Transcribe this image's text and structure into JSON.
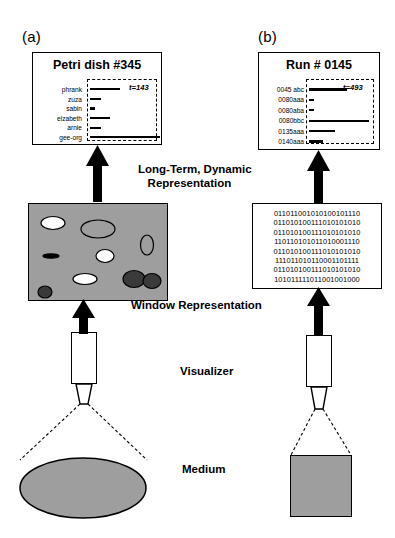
{
  "figure": {
    "panel_a_tag": "(a)",
    "panel_b_tag": "(b)"
  },
  "panel_a": {
    "title": "Petri dish #345",
    "time_label": "t=143",
    "rows": [
      {
        "label": "phrank",
        "bar_width": 30
      },
      {
        "label": "zuza",
        "bar_width": 11
      },
      {
        "label": "sabin",
        "bar_width": 5
      },
      {
        "label": "elzabeth",
        "bar_width": 20
      },
      {
        "label": "arnie",
        "bar_width": 11
      },
      {
        "label": "gee-org",
        "bar_width": 70
      }
    ]
  },
  "panel_b": {
    "title": "Run # 0145",
    "time_label": "t=493",
    "rows": [
      {
        "label": "0045 abc",
        "bar_width": 38
      },
      {
        "label": "0080aaa",
        "bar_width": 5
      },
      {
        "label": "0080aba",
        "bar_width": 5
      },
      {
        "label": "0080bbc",
        "bar_width": 60
      },
      {
        "label": "0135aaa",
        "bar_width": 26
      },
      {
        "label": "0140aaa",
        "bar_width": 14
      }
    ]
  },
  "labels": {
    "long_term": "Long-Term, Dynamic\n   Representation",
    "window": "Window Representation",
    "visualizer": "Visualizer",
    "medium": "Medium"
  },
  "binary_block": {
    "lines": [
      "011011001010100101110",
      "011010100111010101010",
      "011010100111010101010",
      "110110101011010001110",
      "011010100111010101010",
      "111011010110001101111",
      "011010100111010101010",
      "101011111011001001000"
    ]
  },
  "window_representation": {
    "blobs": [
      {
        "cx": 24,
        "cy": 19,
        "rx": 12,
        "ry": 6.5,
        "fill": "#ffffff"
      },
      {
        "cx": 69,
        "cy": 25,
        "rx": 17,
        "ry": 9,
        "fill": "#9e9e9e"
      },
      {
        "cx": 118,
        "cy": 41,
        "rx": 6.5,
        "ry": 10,
        "fill": "#9e9e9e"
      },
      {
        "cx": 76,
        "cy": 52,
        "rx": 9,
        "ry": 6.5,
        "fill": "#ffffff"
      },
      {
        "cx": 22,
        "cy": 52,
        "rx": 8,
        "ry": 2.2,
        "fill": "#000000"
      },
      {
        "cx": 56,
        "cy": 75,
        "rx": 12,
        "ry": 5.5,
        "fill": "#ffffff"
      },
      {
        "cx": 105,
        "cy": 75,
        "rx": 11,
        "ry": 8.5,
        "fill": "#3a3a3a"
      },
      {
        "cx": 123,
        "cy": 77,
        "rx": 9,
        "ry": 7.5,
        "fill": "#3a3a3a"
      },
      {
        "cx": 16,
        "cy": 88,
        "rx": 7,
        "ry": 6,
        "fill": "#3a3a3a"
      }
    ]
  },
  "colors": {
    "ink": "#000000",
    "medium_gray": "#9e9e9e",
    "blob_dark": "#3a3a3a"
  }
}
